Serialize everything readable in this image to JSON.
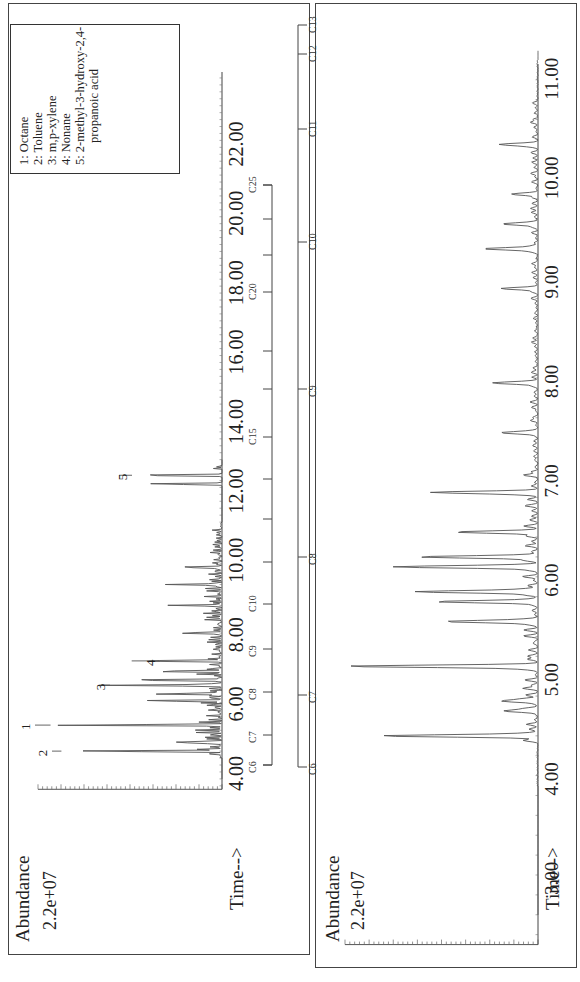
{
  "figure": {
    "top_panel": {
      "y_label": "Abundance",
      "y_max_label": "2.2e+07",
      "x_label": "Time-->",
      "x_ticks": [
        "4.00",
        "6.00",
        "8.00",
        "10.00",
        "12.00",
        "14.00",
        "16.00",
        "18.00",
        "20.00",
        "22.00"
      ],
      "peak_labels": [
        "1",
        "2",
        "3",
        "4",
        "5"
      ],
      "legend": [
        "1:  Octane",
        "2:  Toluene",
        "3:  m,p-xylene",
        "4:  Nonane",
        "5:  2-methyl-3-hydroxy-2,4-",
        "propanoic acid"
      ],
      "carbon_scale": [
        "C6",
        "C7",
        "C8",
        "C9",
        "C10",
        "C15",
        "C20",
        "C25"
      ]
    },
    "bottom_panel": {
      "y_label": "Abundance",
      "y_max_label": "2.2e+07",
      "x_label": "Time-->",
      "x_ticks": [
        "3.00",
        "4.00",
        "5.00",
        "6.00",
        "7.00",
        "8.00",
        "9.00",
        "10.00",
        "11.00"
      ],
      "carbon_scale": [
        "C6",
        "C7",
        "C8",
        "C9",
        "C10",
        "C11",
        "C12",
        "C13"
      ]
    }
  },
  "chart_data": [
    {
      "type": "line",
      "title": "GC-MS total ion chromatogram (full run)",
      "xlabel": "Time-->",
      "ylabel": "Abundance",
      "xlim": [
        3.0,
        23.5
      ],
      "ylim": [
        0,
        22000000
      ],
      "x_ticks": [
        4,
        6,
        8,
        10,
        12,
        14,
        16,
        18,
        20,
        22
      ],
      "annotated_peaks": [
        {
          "label": "1",
          "compound": "Octane",
          "time": 5.15,
          "abundance": 20500000
        },
        {
          "label": "2",
          "compound": "Toluene",
          "time": 4.4,
          "abundance": 19200000
        },
        {
          "label": "3",
          "compound": "m,p-xylene",
          "time": 6.3,
          "abundance": 14500000
        },
        {
          "label": "4",
          "compound": "Nonane",
          "time": 7.0,
          "abundance": 10800000
        },
        {
          "label": "5",
          "compound": "2-methyl-3-hydroxy-2,4-propanoic acid",
          "time": 12.35,
          "abundance": 12300000
        }
      ],
      "other_peaks": [
        {
          "time": 4.65,
          "abundance": 6500000
        },
        {
          "time": 5.85,
          "abundance": 8200000
        },
        {
          "time": 6.05,
          "abundance": 8800000
        },
        {
          "time": 6.45,
          "abundance": 12000000
        },
        {
          "time": 6.7,
          "abundance": 9000000
        },
        {
          "time": 7.8,
          "abundance": 4600000
        },
        {
          "time": 8.6,
          "abundance": 5200000
        },
        {
          "time": 9.2,
          "abundance": 6800000
        },
        {
          "time": 9.7,
          "abundance": 4800000
        },
        {
          "time": 12.1,
          "abundance": 10000000
        }
      ],
      "carbon_markers": {
        "C6": 3.5,
        "C7": 4.55,
        "C8": 5.65,
        "C9": 6.85,
        "C10": 8.3,
        "C15": 13.5,
        "C20": 17.8,
        "C25": 20.8
      }
    },
    {
      "type": "line",
      "title": "GC-MS total ion chromatogram (expanded 3–11.5 min)",
      "xlabel": "Time-->",
      "ylabel": "Abundance",
      "xlim": [
        2.7,
        11.9
      ],
      "ylim": [
        0,
        22000000
      ],
      "x_ticks": [
        3,
        4,
        5,
        6,
        7,
        8,
        9,
        10,
        11
      ],
      "peaks": [
        {
          "time": 4.4,
          "abundance": 18000000
        },
        {
          "time": 4.65,
          "abundance": 3800000
        },
        {
          "time": 4.75,
          "abundance": 4000000
        },
        {
          "time": 5.1,
          "abundance": 21500000
        },
        {
          "time": 5.55,
          "abundance": 10500000
        },
        {
          "time": 5.75,
          "abundance": 11600000
        },
        {
          "time": 5.85,
          "abundance": 14000000
        },
        {
          "time": 6.1,
          "abundance": 16200000
        },
        {
          "time": 6.2,
          "abundance": 13500000
        },
        {
          "time": 6.45,
          "abundance": 9100000
        },
        {
          "time": 6.85,
          "abundance": 11500000
        },
        {
          "time": 7.45,
          "abundance": 4200000
        },
        {
          "time": 7.95,
          "abundance": 5000000
        },
        {
          "time": 8.9,
          "abundance": 3500000
        },
        {
          "time": 9.3,
          "abundance": 6200000
        },
        {
          "time": 9.55,
          "abundance": 4000000
        },
        {
          "time": 9.85,
          "abundance": 2800000
        },
        {
          "time": 10.35,
          "abundance": 4100000
        }
      ],
      "carbon_markers": {
        "C6": 2.7,
        "C7": 3.7,
        "C8": 5.05,
        "C9": 6.75,
        "C10": 8.25,
        "C11": 9.35,
        "C12": 10.4,
        "C13": 11.5
      }
    }
  ]
}
